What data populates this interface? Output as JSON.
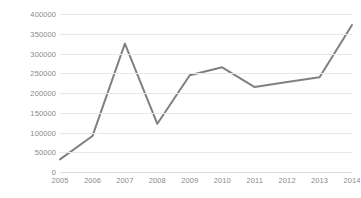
{
  "chart_data": {
    "type": "line",
    "title": "",
    "subtitle": "",
    "xlabel": "",
    "ylabel": "",
    "categories": [
      "2005",
      "2006",
      "2007",
      "2008",
      "2009",
      "2010",
      "2011",
      "2012",
      "2013",
      "2014"
    ],
    "series": [
      {
        "name": "",
        "values": [
          32000,
          91000,
          325000,
          122000,
          245000,
          265000,
          215000,
          228000,
          240000,
          372000
        ],
        "color": "#808080"
      }
    ],
    "ylim": [
      0,
      400000
    ],
    "y_ticks": [
      0,
      50000,
      100000,
      150000,
      200000,
      250000,
      300000,
      350000,
      400000
    ],
    "y_tick_labels": [
      "0",
      "50000",
      "100000",
      "150000",
      "200000",
      "250000",
      "300000",
      "350000",
      "400000"
    ],
    "grid": "horizontal",
    "grid_color": "#e8e8e8",
    "legend": "none",
    "markers": "none",
    "line_width": 2,
    "background": "#ffffff",
    "tick_label_color": "#8a8a8a"
  }
}
